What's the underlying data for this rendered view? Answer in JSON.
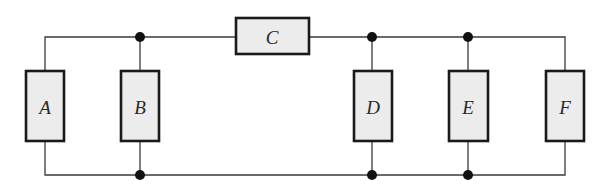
{
  "diagram": {
    "type": "circuit",
    "components": [
      {
        "id": "A",
        "label": "A",
        "orientation": "vertical"
      },
      {
        "id": "B",
        "label": "B",
        "orientation": "vertical"
      },
      {
        "id": "C",
        "label": "C",
        "orientation": "horizontal"
      },
      {
        "id": "D",
        "label": "D",
        "orientation": "vertical"
      },
      {
        "id": "E",
        "label": "E",
        "orientation": "vertical"
      },
      {
        "id": "F",
        "label": "F",
        "orientation": "vertical"
      }
    ],
    "junctions": 6,
    "colors": {
      "wire": "#3a3a3a",
      "box_fill": "#ececec",
      "box_stroke": "#1a1a1a",
      "junction": "#111111"
    }
  }
}
